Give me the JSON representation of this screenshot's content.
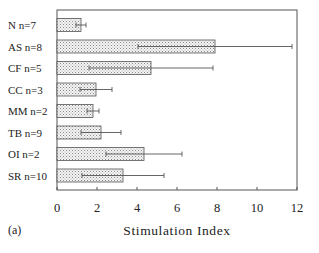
{
  "panel_label": "(a)",
  "chart_data": {
    "type": "bar",
    "orientation": "horizontal",
    "title": "",
    "xlabel": "Stimulation Index",
    "ylabel": "",
    "xlim": [
      0,
      12
    ],
    "xticks": [
      0,
      2,
      4,
      6,
      8,
      10,
      12
    ],
    "grid": false,
    "legend": null,
    "categories": [
      "N  n=7",
      "AS  n=8",
      "CF  n=5",
      "CC  n=3",
      "MM n=2",
      "TB  n=9",
      "OI  n=2",
      "SR  n=10"
    ],
    "values": [
      1.2,
      7.9,
      4.7,
      1.95,
      1.8,
      2.2,
      4.35,
      3.3
    ],
    "error": [
      0.25,
      3.85,
      3.1,
      0.8,
      0.3,
      1.0,
      1.9,
      2.05
    ],
    "bar_fill": "dotted-stipple",
    "panel": "(a)"
  }
}
